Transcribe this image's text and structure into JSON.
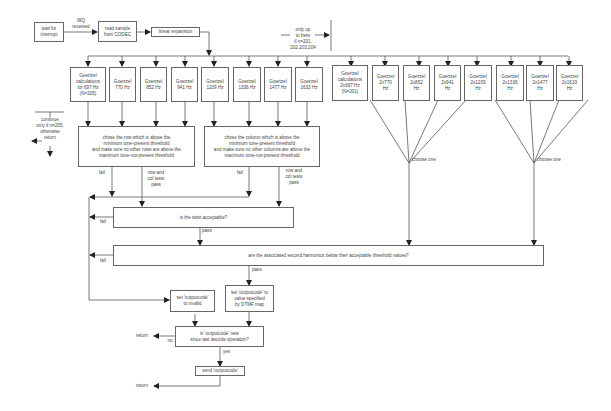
{
  "diagram": {
    "top_flow": {
      "wait": "wait for\ninterrupt",
      "irq": "IRQ\nreceived",
      "read": "read sample\nfrom CODEC",
      "linear": "linear expansion",
      "only_up_to": "only up\nto here\nif n=201,\n202,203,204"
    },
    "continue_note": "continue\nonly if n=205,\notherwise\nreturn",
    "fundamental_boxes": [
      "Goertzel\ncalculations\nfor 697 Hz\n(N=205)",
      "Goertzel\n770 Hz",
      "Goertzel\n852 Hz",
      "Goertzel\n941 Hz",
      "Goertzel\n1209 Hz",
      "Goertzel\n1336 Hz",
      "Goertzel\n1477 Hz",
      "Goertzel\n1633 Hz"
    ],
    "harmonic_boxes": [
      "Goertzel\ncalculations\n2x697 Hz\n(N=201)",
      "Goertzel\n2x770\nHz",
      "Goertzel\n2x852\nHz",
      "Goertzel\n2x941\nHz",
      "Goertzel\n2x1209\nHz",
      "Goertzel\n2x1336\nHz",
      "Goertzel\n2x1477\nHz",
      "Goertzel\n2x1633\nHz"
    ],
    "row_box": "chose the row which is above the\nminimum tone-present threshold\nand make sure no other rows are above the\nmaximum tone-not-present threshold",
    "col_box": "chose the column which is above the\nminimum tone-present threshold\nand make sure no other columns are above the\nmaximum tone-not-present threshold",
    "choose_one": "choose one",
    "fail": "fail",
    "row_col_pass": "row and\ncol tests\npass",
    "pass": "pass",
    "twist_box": "is the twist acceptable?",
    "harmonics_box": "are the associated second harmonics below their acceptable threshold values?",
    "invalid_box": "set 'outputcode'\nto invalid",
    "set_value_box": "set 'outputcode' to\nvalue specified\nby DTMF map",
    "new_box": "is 'outputcode' new\nsince last decode operation?",
    "no": "no",
    "yes": "yes",
    "return": "return",
    "send_box": "send 'outputcode'"
  }
}
